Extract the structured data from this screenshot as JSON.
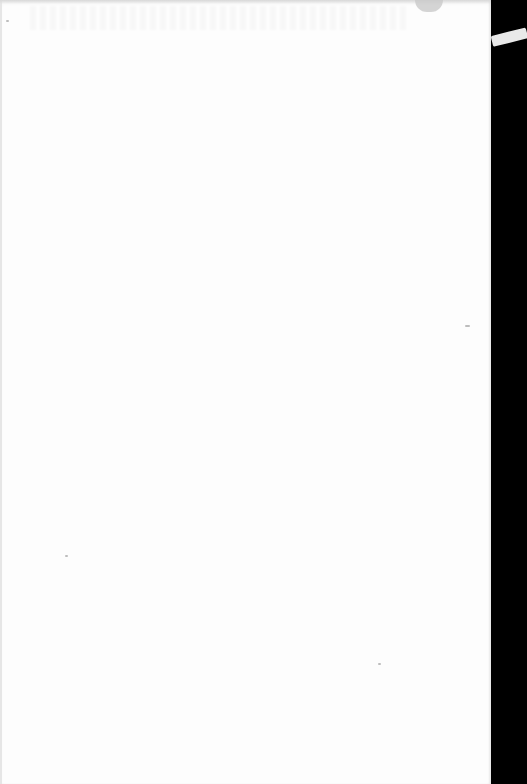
{
  "document": {
    "type": "scanned-page",
    "content": "",
    "is_blank": true
  },
  "colors": {
    "paper": "#fdfdfd",
    "background": "#000000"
  }
}
